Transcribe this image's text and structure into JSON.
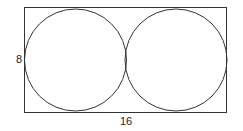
{
  "diagram": {
    "type": "geometry",
    "rectangle": {
      "height_label": "8",
      "width_label": "16"
    },
    "circles": [
      {
        "name": "left-circle"
      },
      {
        "name": "right-circle"
      }
    ],
    "colors": {
      "stroke": "#333333",
      "background": "#ffffff"
    }
  }
}
